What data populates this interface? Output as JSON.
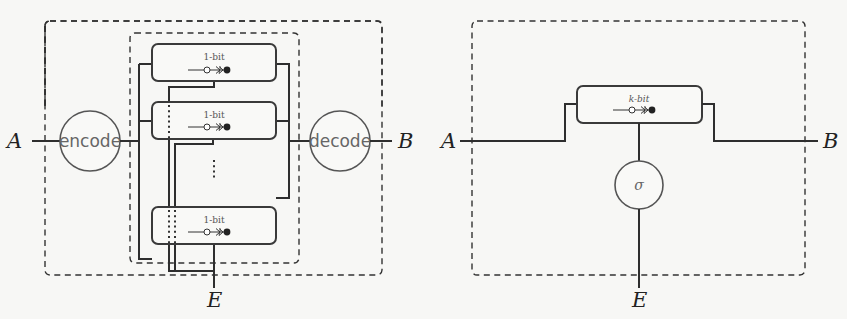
{
  "left_diagram": {
    "input_label": "A",
    "output_label": "B",
    "env_label": "E",
    "encode_label": "encode",
    "decode_label": "decode",
    "channels": [
      {
        "label": "1-bit"
      },
      {
        "label": "1-bit"
      },
      {
        "label": "1-bit"
      }
    ]
  },
  "right_diagram": {
    "input_label": "A",
    "output_label": "B",
    "env_label": "E",
    "channel_label": "k-bit",
    "node_label": "σ"
  },
  "colors": {
    "wire": "#2e2e2e",
    "node_text": "#666666",
    "background": "#f7f7f5"
  }
}
